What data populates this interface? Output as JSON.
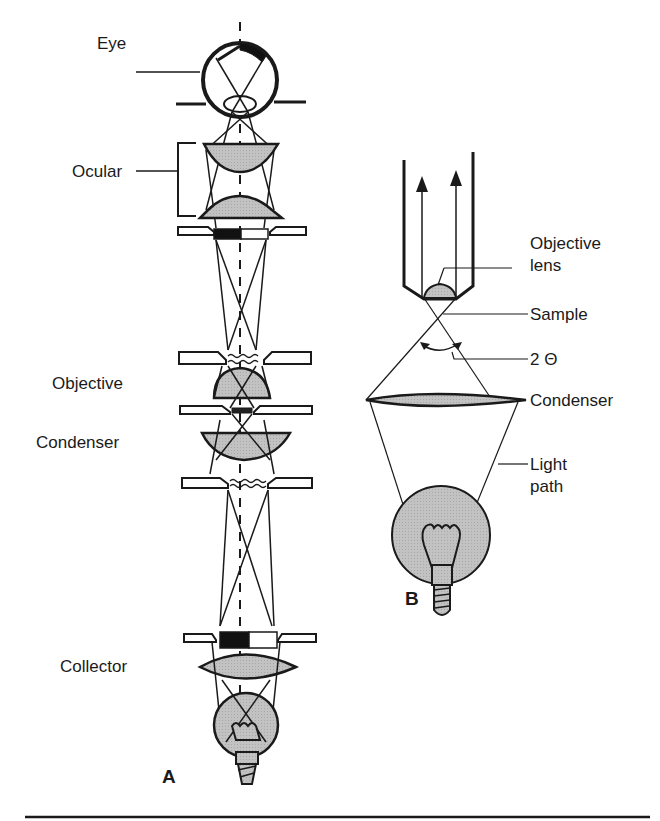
{
  "diagram": {
    "colors": {
      "stroke": "#1a1a1a",
      "lens_fill": "#bdbdbd",
      "bulb_fill": "#c4c4c4",
      "background": "#ffffff"
    },
    "panel_a": {
      "letter": "A",
      "labels": {
        "eye": "Eye",
        "ocular": "Ocular",
        "objective": "Objective",
        "condenser": "Condenser",
        "collector": "Collector"
      }
    },
    "panel_b": {
      "letter": "B",
      "labels": {
        "objective_lens_line1": "Objective",
        "objective_lens_line2": "lens",
        "sample": "Sample",
        "angle": "2 Θ",
        "condenser": "Condenser",
        "light_path_line1": "Light",
        "light_path_line2": "path"
      }
    }
  }
}
